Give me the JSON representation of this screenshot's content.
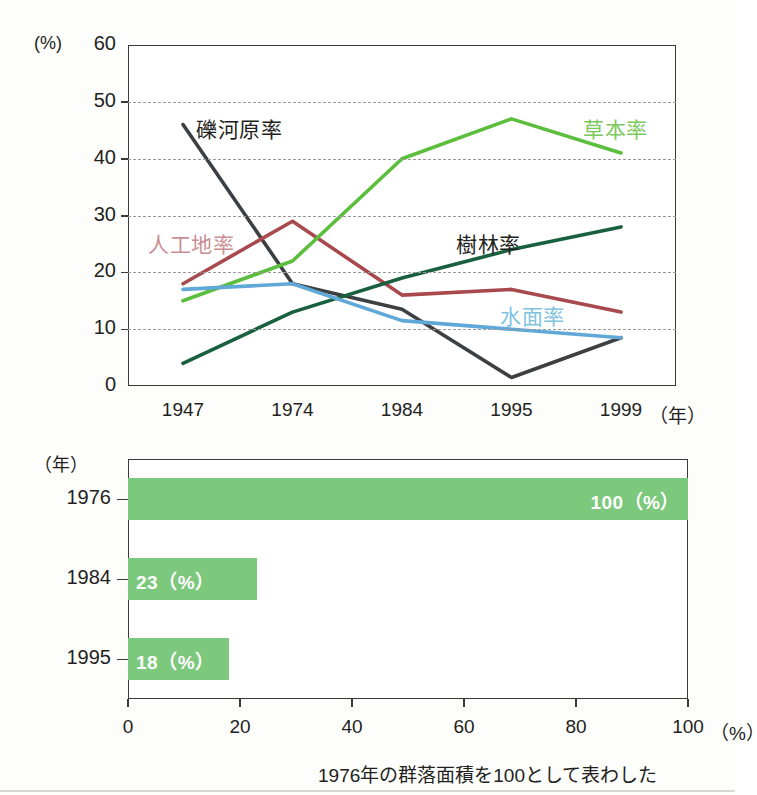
{
  "chart_data": [
    {
      "type": "line",
      "title": "",
      "xlabel": "(年)",
      "ylabel": "(%)",
      "ylim": [
        0,
        60
      ],
      "yticks": [
        0,
        10,
        20,
        30,
        40,
        50,
        60
      ],
      "ytick_labels": [
        "0",
        "10",
        "20",
        "30",
        "40",
        "50",
        "60"
      ],
      "grid": "horizontal-dashed",
      "legend": "inline-labels",
      "categories": [
        "1947",
        "1974",
        "1984",
        "1995",
        "1999"
      ],
      "x": [
        1947,
        1974,
        1984,
        1995,
        1999
      ],
      "series": [
        {
          "name": "礫河原率",
          "color": "#3d4042",
          "label_color": "#231f20",
          "values": [
            46,
            18,
            13.5,
            1.5,
            8.5
          ],
          "label_x": 196,
          "label_y": 113
        },
        {
          "name": "人工地率",
          "color": "#a8494d",
          "label_color": "#c98e93",
          "values": [
            18,
            29,
            16,
            17,
            13
          ],
          "label_x": 148,
          "label_y": 228
        },
        {
          "name": "草本率",
          "color": "#5cbe3d",
          "label_color": "#7cc85c",
          "values": [
            15,
            22,
            40,
            47,
            41
          ],
          "label_x": 583,
          "label_y": 113
        },
        {
          "name": "樹林率",
          "color": "#19603f",
          "label_color": "#231f20",
          "values": [
            4,
            13,
            19,
            24,
            28
          ],
          "label_x": 456,
          "label_y": 228
        },
        {
          "name": "水面率",
          "color": "#5fa8d8",
          "label_color": "#7fc3e0",
          "values": [
            17,
            18,
            11.5,
            10,
            8.5
          ],
          "label_x": 500,
          "label_y": 300
        }
      ]
    },
    {
      "type": "bar",
      "orientation": "horizontal",
      "title": "",
      "xlabel": "(%)",
      "ylabel": "(年)",
      "xlim": [
        0,
        100
      ],
      "xticks": [
        0,
        20,
        40,
        60,
        80,
        100
      ],
      "xtick_labels": [
        "0",
        "20",
        "40",
        "60",
        "80",
        "100"
      ],
      "grid": "none",
      "bar_color": "#7cc87c",
      "categories": [
        "1976",
        "1984",
        "1995"
      ],
      "values": [
        100,
        23,
        18
      ],
      "value_labels": [
        "100（%）",
        "23（%）",
        "18（%）"
      ],
      "note": "1976年の群落面積を100として表わした"
    }
  ],
  "line_chart": {
    "unit_label": "(%)",
    "year_unit": "（年）",
    "ytick_labels": [
      "60",
      "50",
      "40",
      "30",
      "20",
      "10",
      "0"
    ],
    "xtick_labels": [
      "1947",
      "1974",
      "1984",
      "1995",
      "1999"
    ],
    "series_labels": [
      "礫河原率",
      "人工地率",
      "草本率",
      "樹林率",
      "水面率"
    ]
  },
  "bar_chart": {
    "unit_label": "（年）",
    "percent_unit": "（%）",
    "ytick_labels": [
      "1976",
      "1984",
      "1995"
    ],
    "xtick_labels": [
      "0",
      "20",
      "40",
      "60",
      "80",
      "100"
    ],
    "value_labels": [
      "100（%）",
      "23（%）",
      "18（%）"
    ],
    "caption": "1976年の群落面積を100として表わした"
  }
}
